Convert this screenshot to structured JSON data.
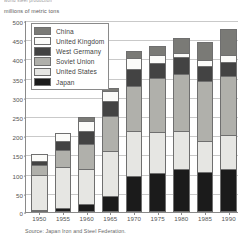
{
  "clipped_caption": "world steel production",
  "chart_data": {
    "type": "bar",
    "subtype": "stacked-vertical",
    "title": "",
    "ylabel": "millions of metric tons",
    "xlabel": "",
    "ylim": [
      0,
      500
    ],
    "ytick_step": 50,
    "yticks": [
      "500",
      "450",
      "400",
      "350",
      "300",
      "250",
      "200",
      "150",
      "100",
      "50",
      "0"
    ],
    "grid": true,
    "grid_axis": "y",
    "legend_position": "upper-left-inside",
    "categories": [
      "1950",
      "1955",
      "1960",
      "1965",
      "1970",
      "1975",
      "1980",
      "1985",
      "1990"
    ],
    "series": [
      {
        "name": "Japan",
        "color": "#1b1b1b",
        "values": [
          5,
          10,
          22,
          41,
          93,
          102,
          111,
          105,
          111
        ]
      },
      {
        "name": "United States",
        "color": "#e6e6e3",
        "values": [
          90,
          106,
          90,
          119,
          119,
          106,
          101,
          80,
          89
        ]
      },
      {
        "name": "Soviet Union",
        "color": "#b0b0ab",
        "values": [
          27,
          45,
          65,
          91,
          116,
          141,
          148,
          155,
          154
        ]
      },
      {
        "name": "West Germany",
        "color": "#434343",
        "values": [
          12,
          24,
          34,
          37,
          45,
          40,
          44,
          40,
          38
        ]
      },
      {
        "name": "United Kingdom",
        "color": "#fbfbf9",
        "values": [
          17,
          20,
          25,
          27,
          28,
          20,
          11,
          16,
          18
        ]
      },
      {
        "name": "China",
        "color": "#7a7a76",
        "values": [
          0,
          0,
          12,
          8,
          18,
          24,
          37,
          47,
          66
        ]
      }
    ],
    "totals": [
      151,
      205,
      248,
      323,
      419,
      433,
      452,
      443,
      476
    ],
    "legend_order": [
      "China",
      "United Kingdom",
      "West Germany",
      "Soviet Union",
      "United States",
      "Japan"
    ],
    "source": "Source: Japan Iron and Steel Federation."
  }
}
